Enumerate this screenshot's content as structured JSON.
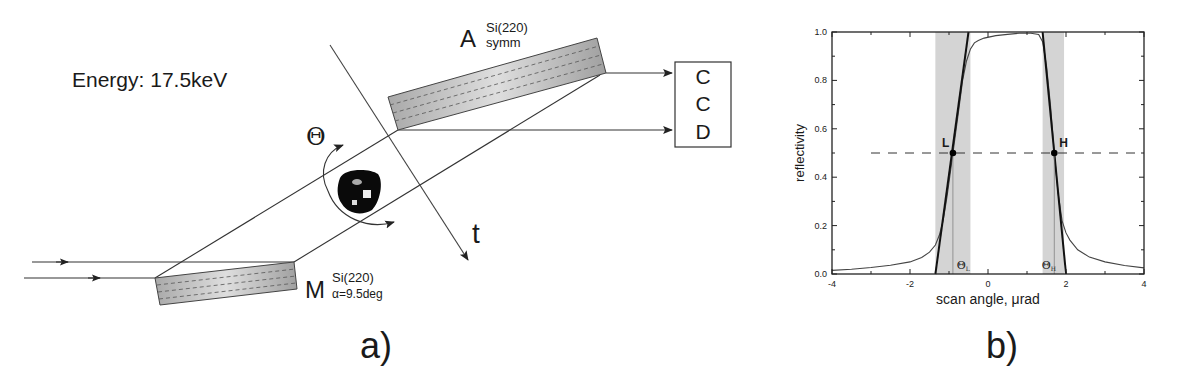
{
  "panel_a": {
    "energy_label": "Energy: 17.5keV",
    "analyzer": {
      "letter": "A",
      "sup": "Si(220)",
      "sub": "symm"
    },
    "monochromator": {
      "letter": "M",
      "sup": "Si(220)",
      "sub": "α=9.5deg"
    },
    "detector": {
      "lines": [
        "C",
        "C",
        "D"
      ]
    },
    "rotation_symbol": "Θ",
    "translation_label": "t",
    "caption": "a)"
  },
  "panel_b": {
    "caption": "b)",
    "point_labels": {
      "L": "L",
      "H": "H"
    },
    "theta_labels": {
      "L_main": "Θ",
      "L_sub": "L",
      "H_main": "Θ",
      "H_sub": "H"
    }
  },
  "chart_data": {
    "type": "line",
    "title": "",
    "xlabel": "scan angle,  μrad",
    "ylabel": "reflectivity",
    "xlim": [
      -4,
      4
    ],
    "ylim": [
      0,
      1.0
    ],
    "xticks": [
      -4,
      -2,
      0,
      2,
      4
    ],
    "yticks": [
      0.0,
      0.2,
      0.4,
      0.6,
      0.8,
      1.0
    ],
    "xtick_labels": [
      "-4",
      "-2",
      "0",
      "2",
      "4"
    ],
    "ytick_labels": [
      "0.0",
      "0.2",
      "0.4",
      "0.6",
      "0.8",
      "1.0"
    ],
    "grid": false,
    "series": [
      {
        "name": "measured reflectivity",
        "x": [
          -4.0,
          -3.5,
          -3.0,
          -2.5,
          -2.0,
          -1.7,
          -1.5,
          -1.35,
          -1.25,
          -1.15,
          -1.05,
          -0.95,
          -0.85,
          -0.75,
          -0.65,
          -0.55,
          -0.45,
          -0.35,
          -0.25,
          -0.1,
          0.2,
          0.5,
          0.8,
          1.1,
          1.3,
          1.4,
          1.5,
          1.6,
          1.7,
          1.8,
          1.9,
          2.0,
          2.1,
          2.3,
          2.6,
          3.0,
          3.5,
          4.0
        ],
        "y": [
          0.015,
          0.02,
          0.027,
          0.036,
          0.05,
          0.068,
          0.09,
          0.12,
          0.16,
          0.22,
          0.32,
          0.44,
          0.56,
          0.68,
          0.8,
          0.88,
          0.93,
          0.955,
          0.965,
          0.975,
          0.985,
          0.99,
          0.995,
          0.995,
          0.99,
          0.96,
          0.86,
          0.7,
          0.5,
          0.33,
          0.22,
          0.17,
          0.14,
          0.1,
          0.07,
          0.05,
          0.035,
          0.025
        ]
      },
      {
        "name": "left steep fit",
        "x": [
          -1.35,
          -0.5
        ],
        "y": [
          0.0,
          1.0
        ]
      },
      {
        "name": "right steep fit",
        "x": [
          2.0,
          1.4
        ],
        "y": [
          0.0,
          1.0
        ]
      }
    ],
    "reference_line": {
      "y": 0.5,
      "style": "dashed"
    },
    "shaded_bands": [
      {
        "x0": -1.35,
        "x1": -0.45
      },
      {
        "x0": 1.4,
        "x1": 1.95
      }
    ],
    "points": [
      {
        "label": "L",
        "x": -0.9,
        "y": 0.5
      },
      {
        "label": "H",
        "x": 1.7,
        "y": 0.5
      }
    ]
  }
}
